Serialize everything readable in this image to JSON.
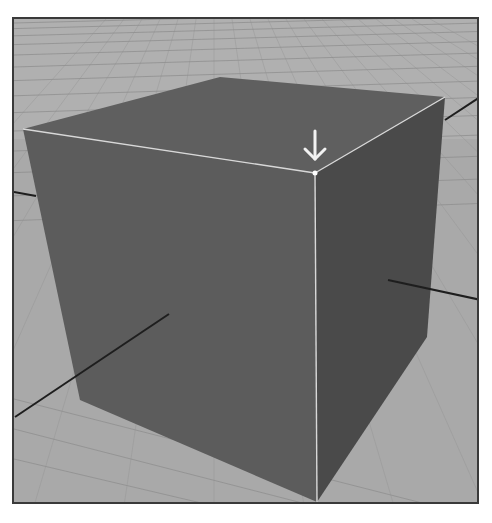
{
  "viewport": {
    "label": "3D perspective viewport",
    "background_color": "#a9a9a9",
    "far_ground_color": "#b0b0b0",
    "grid_line_color": "#8f8f8f"
  },
  "cube": {
    "name": "Cube",
    "top_face_color": "#5f5f5f",
    "front_face_color": "#5c5c5c",
    "right_face_color": "#4a4a4a",
    "highlight_edge_color": "#d8d8d8",
    "selected_vertex_color": "#ffffff"
  },
  "annotation": {
    "icon": "arrow-down-icon",
    "points_to": "selected vertex",
    "color": "#f2f2f2"
  },
  "axes": {
    "color": "#1e1e1e"
  }
}
